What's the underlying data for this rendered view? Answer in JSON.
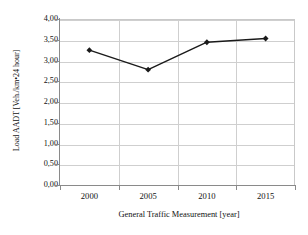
{
  "chart_data": {
    "type": "line",
    "title": "",
    "subtitle": "",
    "xlabel": "General Traffic Measurement [year]",
    "ylabel": "Load AADT [Veh./km•24 hour]",
    "categories": [
      "2000",
      "2005",
      "2010",
      "2015"
    ],
    "x_tick_labels": [
      "2000",
      "2005",
      "2010",
      "2015"
    ],
    "y_tick_labels": [
      "0,00",
      "0,50",
      "1,00",
      "1,50",
      "2,00",
      "2,50",
      "3,00",
      "3,50",
      "4,00"
    ],
    "y_tick_values": [
      0.0,
      0.5,
      1.0,
      1.5,
      2.0,
      2.5,
      3.0,
      3.5,
      4.0
    ],
    "ylim": [
      0.0,
      4.0
    ],
    "values": [
      3.25,
      2.78,
      3.44,
      3.53
    ],
    "series": [
      {
        "name": "Load AADT",
        "values": [
          3.25,
          2.78,
          3.44,
          3.53
        ],
        "marker": "diamond",
        "line_color": "#1a1a1a",
        "marker_color": "#1a1a1a"
      }
    ],
    "grid": {
      "horizontal": true,
      "vertical": true,
      "color": "#cfcfcf"
    },
    "legend": {
      "visible": false,
      "position": "none",
      "entries": []
    },
    "axis_color": "#8a8a8a",
    "decimal_separator": ","
  }
}
